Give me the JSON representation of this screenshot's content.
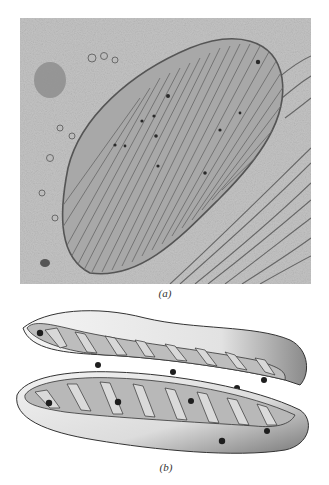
{
  "figure": {
    "panel_a": {
      "label": "(a)",
      "kind": "electron-micrograph",
      "subject": "mitochondrion cross-section with cristae"
    },
    "panel_b": {
      "label": "(b)",
      "kind": "illustration",
      "subject": "cutaway drawing of mitochondrion showing inner membrane folds"
    },
    "caption_fragment": ""
  },
  "colors": {
    "micrograph_bg": "#bdbdbd",
    "membrane": "#5a5a5a",
    "matrix": "#9e9e9e",
    "granule": "#2a2a2a",
    "drawing_fill": "#efefef",
    "drawing_shade": "#7a7a7a"
  }
}
